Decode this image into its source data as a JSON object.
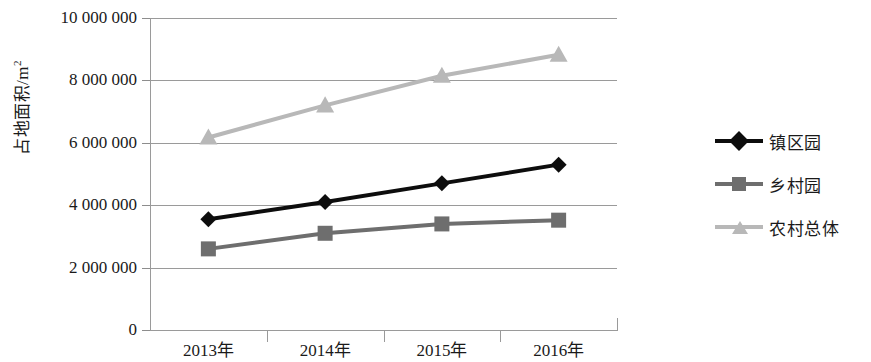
{
  "chart_data": {
    "type": "line",
    "title": "",
    "xlabel": "",
    "ylabel": "占地面积/m²",
    "ylabel_main": "占地面积/m",
    "ylabel_sup": "2",
    "categories": [
      "2013年",
      "2014年",
      "2015年",
      "2016年"
    ],
    "ylim": [
      0,
      10000000
    ],
    "ytick_step": 2000000,
    "ytick_labels": [
      "10 000 000",
      "8 000 000",
      "6 000 000",
      "4 000 000",
      "2 000 000",
      "0"
    ],
    "ytick_values": [
      10000000,
      8000000,
      6000000,
      4000000,
      2000000,
      0
    ],
    "grid": true,
    "legend_position": "right",
    "series": [
      {
        "name": "镇区园",
        "values": [
          3550000,
          4100000,
          4700000,
          5300000
        ],
        "color": "#0d0d0d",
        "marker": "diamond"
      },
      {
        "name": "乡村园",
        "values": [
          2600000,
          3100000,
          3400000,
          3520000
        ],
        "color": "#6e6e6e",
        "marker": "square"
      },
      {
        "name": "农村总体",
        "values": [
          6170000,
          7200000,
          8150000,
          8820000
        ],
        "color": "#b8b8b8",
        "marker": "triangle"
      }
    ]
  },
  "axis": {
    "grid_color": "#9a9a9a",
    "tick_color": "#8d8d8d"
  }
}
